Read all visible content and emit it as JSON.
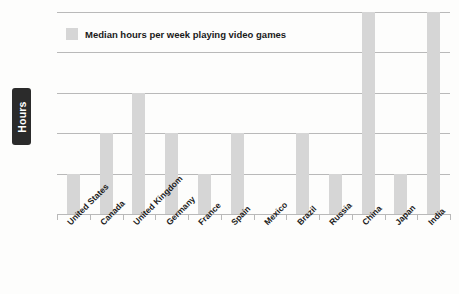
{
  "chart_data": {
    "type": "bar",
    "title": "",
    "subtitle": "",
    "xlabel": "",
    "ylabel": "Hours",
    "ylim": [
      0,
      5
    ],
    "ytick_labels": [
      "0",
      "1",
      "2",
      "3",
      "4",
      "5"
    ],
    "ytick_values": [
      0,
      1,
      2,
      3,
      4,
      5
    ],
    "grid": true,
    "grid_axis": "y",
    "legend_position": "top-left-inside",
    "legend": [
      "Median hours per week playing video games"
    ],
    "bar_color": "#d6d6d6",
    "gridline_color": "#b9b9b9",
    "background_color": "#fdfdfc",
    "axis_label_background": "#2b2b2b",
    "axis_label_color": "#ffffff",
    "categories": [
      "United States",
      "Canada",
      "United Kingdom",
      "Germany",
      "France",
      "Spain",
      "Mexico",
      "Brazil",
      "Russia",
      "China",
      "Japan",
      "India"
    ],
    "values": [
      1,
      2,
      3,
      2,
      1,
      2,
      0,
      2,
      1,
      5,
      1,
      5
    ],
    "series": [
      {
        "name": "Median hours per week playing video games",
        "values": [
          1,
          2,
          3,
          2,
          1,
          2,
          0,
          2,
          1,
          5,
          1,
          5
        ]
      }
    ]
  }
}
